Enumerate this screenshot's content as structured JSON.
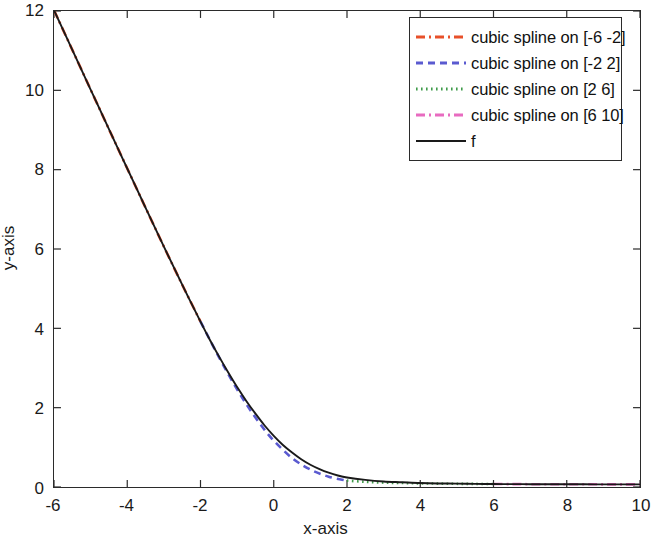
{
  "chart_data": {
    "type": "line",
    "title": "",
    "xlabel": "x-axis",
    "ylabel": "y-axis",
    "xlim": [
      -6,
      10
    ],
    "ylim": [
      0,
      12
    ],
    "xticks": [
      -6,
      -4,
      -2,
      0,
      2,
      4,
      6,
      8,
      10
    ],
    "xticklabels": [
      "-6",
      "-4",
      "-2",
      "0",
      "2",
      "4",
      "6",
      "8",
      "10"
    ],
    "yticks": [
      0,
      2,
      4,
      6,
      8,
      10,
      12
    ],
    "yticklabels": [
      "0",
      "2",
      "4",
      "6",
      "8",
      "10",
      "12"
    ],
    "grid": false,
    "legend_position": "upper right",
    "series": [
      {
        "name": "cubic spline on [-6 -2]",
        "color": "#e8502a",
        "style": "dashdot",
        "x": [
          -6,
          -5.5,
          -5,
          -4.5,
          -4,
          -3.5,
          -3,
          -2.5,
          -2
        ],
        "y": [
          12.02,
          11.02,
          10.02,
          9.02,
          8.03,
          7.04,
          6.06,
          5.1,
          4.17
        ]
      },
      {
        "name": "cubic spline on [-2 2]",
        "color": "#5a5ad0",
        "style": "dashed",
        "x": [
          -2,
          -1.75,
          -1.5,
          -1.25,
          -1,
          -0.75,
          -0.5,
          -0.25,
          0,
          0.5,
          1,
          1.5,
          2
        ],
        "y": [
          4.17,
          3.72,
          3.28,
          2.86,
          2.46,
          2.09,
          1.75,
          1.44,
          1.17,
          0.73,
          0.44,
          0.26,
          0.16
        ]
      },
      {
        "name": "cubic spline on [2 6]",
        "color": "#3f9b4a",
        "style": "dotted",
        "x": [
          2,
          2.5,
          3,
          3.5,
          4,
          4.5,
          5,
          5.5,
          6
        ],
        "y": [
          0.16,
          0.13,
          0.11,
          0.1,
          0.09,
          0.085,
          0.08,
          0.078,
          0.075
        ]
      },
      {
        "name": "cubic spline on [6 10]",
        "color": "#e86bc0",
        "style": "dashdot",
        "x": [
          6,
          6.5,
          7,
          7.5,
          8,
          8.5,
          9,
          9.5,
          10
        ],
        "y": [
          0.075,
          0.073,
          0.071,
          0.07,
          0.069,
          0.068,
          0.067,
          0.066,
          0.065
        ]
      },
      {
        "name": "f",
        "color": "#1a1a1a",
        "style": "solid",
        "x": [
          -6,
          -5.5,
          -5,
          -4.5,
          -4,
          -3.5,
          -3,
          -2.5,
          -2,
          -1.75,
          -1.5,
          -1.25,
          -1,
          -0.75,
          -0.5,
          -0.25,
          0,
          0.25,
          0.5,
          0.75,
          1,
          1.25,
          1.5,
          1.75,
          2,
          2.5,
          3,
          3.5,
          4,
          4.5,
          5,
          5.5,
          6,
          6.5,
          7,
          7.5,
          8,
          8.5,
          9,
          9.5,
          10
        ],
        "y": [
          12.02,
          11.02,
          10.02,
          9.02,
          8.03,
          7.04,
          6.06,
          5.1,
          4.17,
          3.72,
          3.3,
          2.9,
          2.52,
          2.17,
          1.85,
          1.55,
          1.29,
          1.06,
          0.87,
          0.7,
          0.56,
          0.45,
          0.36,
          0.29,
          0.24,
          0.18,
          0.14,
          0.12,
          0.1,
          0.09,
          0.085,
          0.08,
          0.075,
          0.073,
          0.071,
          0.07,
          0.069,
          0.068,
          0.067,
          0.066,
          0.065
        ]
      }
    ]
  },
  "legend": {
    "items": [
      {
        "label": "cubic spline on [-6 -2]",
        "color": "#e8502a",
        "style": "dashdot",
        "icon": "line-sample-dashdot-red"
      },
      {
        "label": "cubic spline on [-2 2]",
        "color": "#5a5ad0",
        "style": "dashed",
        "icon": "line-sample-dashed-blue"
      },
      {
        "label": "cubic spline on [2 6]",
        "color": "#3f9b4a",
        "style": "dotted",
        "icon": "line-sample-dotted-green"
      },
      {
        "label": "cubic spline on [6 10]",
        "color": "#e86bc0",
        "style": "dashdot",
        "icon": "line-sample-dashdot-magenta"
      },
      {
        "label": "f",
        "color": "#1a1a1a",
        "style": "solid",
        "icon": "line-sample-solid-black"
      }
    ]
  }
}
